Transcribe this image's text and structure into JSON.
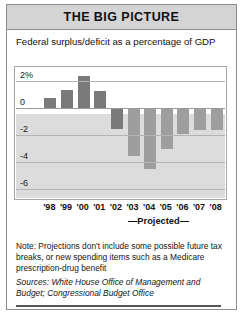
{
  "header": {
    "title": "THE BIG PICTURE"
  },
  "subtitle": "Federal surplus/deficit as a percentage of GDP",
  "projected_label": "—Projected—",
  "note": "Note: Projections don't include some possible future tax breaks, or new spending items such as a Medicare prescription-drug benefit",
  "sources": "Sources: White House Office of Management and Budget; Congressional Budget Office",
  "colors": {
    "header_band": "#d4d4d4",
    "bar_actual": "#7a7a7a",
    "bar_projected": "#9e9e9e",
    "negative_region": "#dcdcdc",
    "frame": "#8d8d8d"
  },
  "chart_data": {
    "type": "bar",
    "title": "Federal surplus/deficit as a percentage of GDP",
    "xlabel": "",
    "ylabel": "",
    "ylim": [
      -6.8,
      3.0
    ],
    "grid": true,
    "legend": "none",
    "ytick_labels": [
      "2%",
      "0",
      "-2",
      "-4",
      "-6"
    ],
    "ytick_values": [
      2,
      0,
      -2,
      -4,
      -6
    ],
    "categories": [
      "'98",
      "'99",
      "'00",
      "'01",
      "'02",
      "'03",
      "'04",
      "'05",
      "'06",
      "'07",
      "'08"
    ],
    "values": [
      0.8,
      1.4,
      2.4,
      1.3,
      -1.5,
      -3.5,
      -4.5,
      -3.0,
      -1.9,
      -1.6,
      -1.6
    ],
    "projected_from": "'03",
    "series": [
      {
        "name": "Federal surplus/deficit (% of GDP)",
        "values": [
          0.8,
          1.4,
          2.4,
          1.3,
          -1.5,
          -3.5,
          -4.5,
          -3.0,
          -1.9,
          -1.6,
          -1.6
        ],
        "projected": [
          false,
          false,
          false,
          false,
          false,
          true,
          true,
          true,
          true,
          true,
          true
        ]
      }
    ]
  }
}
